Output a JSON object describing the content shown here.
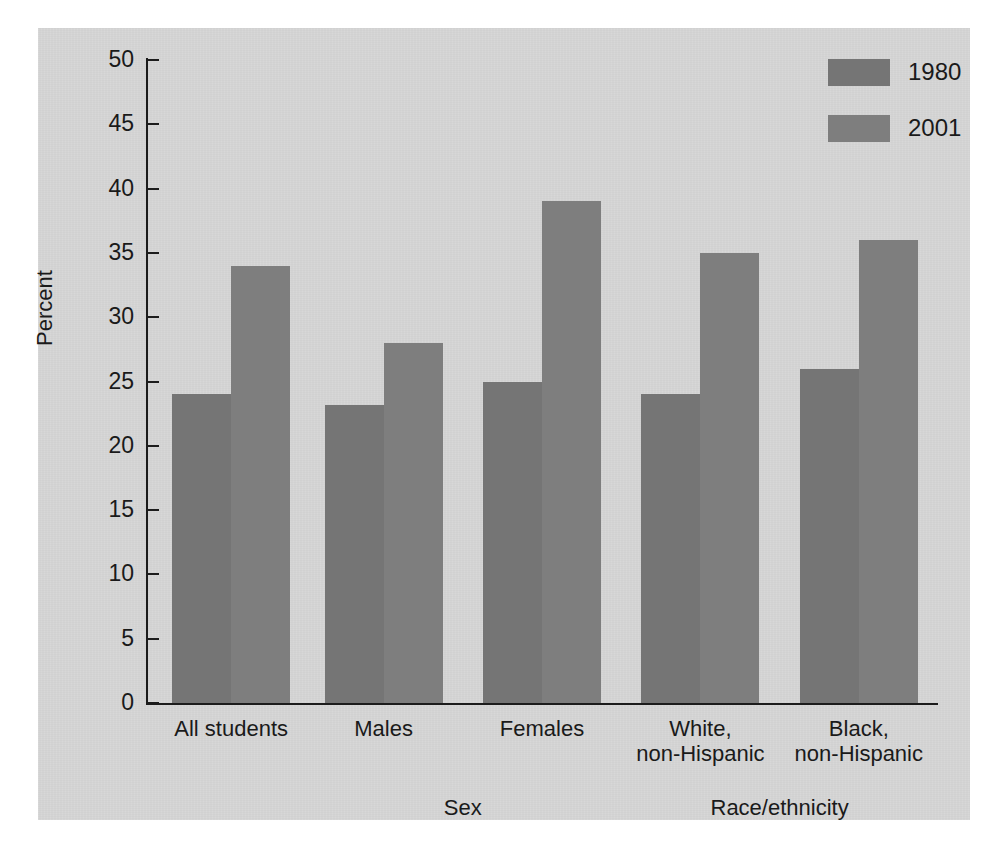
{
  "chart_data": {
    "type": "bar",
    "title": "",
    "xlabel": "",
    "ylabel": "Percent",
    "ylim": [
      0,
      50
    ],
    "yticks": [
      0,
      5,
      10,
      15,
      20,
      25,
      30,
      35,
      40,
      45,
      50
    ],
    "ytick_labels": [
      "0",
      "5",
      "10",
      "15",
      "20",
      "25",
      "30",
      "35",
      "40",
      "45",
      "50"
    ],
    "grid": false,
    "legend_position": "top-right",
    "categories": [
      "All students",
      "Males",
      "Females",
      "White,\nnon-Hispanic",
      "Black,\nnon-Hispanic"
    ],
    "series": [
      {
        "name": "1980",
        "color": "#757575",
        "values": [
          24,
          23.2,
          25,
          24,
          26
        ]
      },
      {
        "name": "2001",
        "color": "#7e7e7e",
        "values": [
          34,
          28,
          39,
          35,
          36
        ]
      }
    ],
    "group_labels": [
      {
        "label": "Sex",
        "categories": [
          "Males",
          "Females"
        ]
      },
      {
        "label": "Race/ethnicity",
        "categories": [
          "White,\nnon-Hispanic",
          "Black,\nnon-Hispanic"
        ]
      }
    ]
  },
  "legend": {
    "entries": [
      {
        "label": "1980"
      },
      {
        "label": "2001"
      }
    ]
  },
  "axis": {
    "y_title": "Percent"
  },
  "groups": {
    "sex": "Sex",
    "race": "Race/ethnicity"
  },
  "colors": {
    "panel_background": "#d6d6d6",
    "page_background": "#ffffff",
    "axis": "#1c1c1c",
    "series_1980": "#757575",
    "series_2001": "#7e7e7e",
    "text": "#1a1a1a"
  }
}
